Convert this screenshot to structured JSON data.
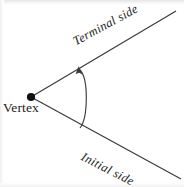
{
  "figure": {
    "background_color": "#ffffff",
    "ink_color": "#3c3c40",
    "labels": {
      "vertex": "Vertex",
      "terminal_side": "Terminal side",
      "initial_side": "Initial side"
    },
    "geometry": {
      "vertex_point": {
        "x": 31,
        "y": 97
      },
      "terminal_ray_end": {
        "x": 176,
        "y": 11
      },
      "initial_ray_end": {
        "x": 181,
        "y": 179
      },
      "arc_start": {
        "x": 80,
        "y": 128
      },
      "arc_end": {
        "x": 79,
        "y": 68
      },
      "arc_apex": {
        "x": 88,
        "y": 98
      },
      "arrow_direction": "counterclockwise-toward-terminal-side",
      "terminal_angle_degrees": -30.6,
      "initial_angle_degrees": 30.5
    },
    "icons": {
      "vertex": "filled-dot-icon",
      "rotation": "curved-arrow-icon"
    }
  }
}
